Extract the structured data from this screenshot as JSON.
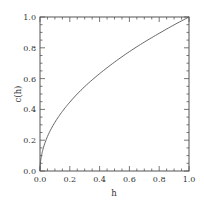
{
  "chart_data": {
    "type": "line",
    "title": "",
    "xlabel": "h",
    "ylabel": "c(h)",
    "xlim": [
      0.0,
      1.0
    ],
    "ylim": [
      0.0,
      1.0
    ],
    "grid": false,
    "legend": null,
    "x_ticks": [
      "0.0",
      "0.2",
      "0.4",
      "0.6",
      "0.8",
      "1.0"
    ],
    "y_ticks": [
      "0.0",
      "0.2",
      "0.4",
      "0.6",
      "0.8",
      "1.0"
    ],
    "minor_ticks_per_major": 3,
    "tick_direction": "in",
    "series": [
      {
        "name": "c(h)",
        "color": "#555555",
        "x": [
          0.0,
          0.01,
          0.02,
          0.05,
          0.1,
          0.15,
          0.2,
          0.3,
          0.4,
          0.5,
          0.6,
          0.7,
          0.8,
          0.9,
          1.0
        ],
        "y": [
          0.0,
          0.1,
          0.141,
          0.224,
          0.316,
          0.387,
          0.447,
          0.548,
          0.632,
          0.707,
          0.775,
          0.837,
          0.894,
          0.949,
          1.0
        ]
      }
    ]
  },
  "colors": {
    "axis": "#555555",
    "text": "#333333",
    "background": "#ffffff"
  }
}
